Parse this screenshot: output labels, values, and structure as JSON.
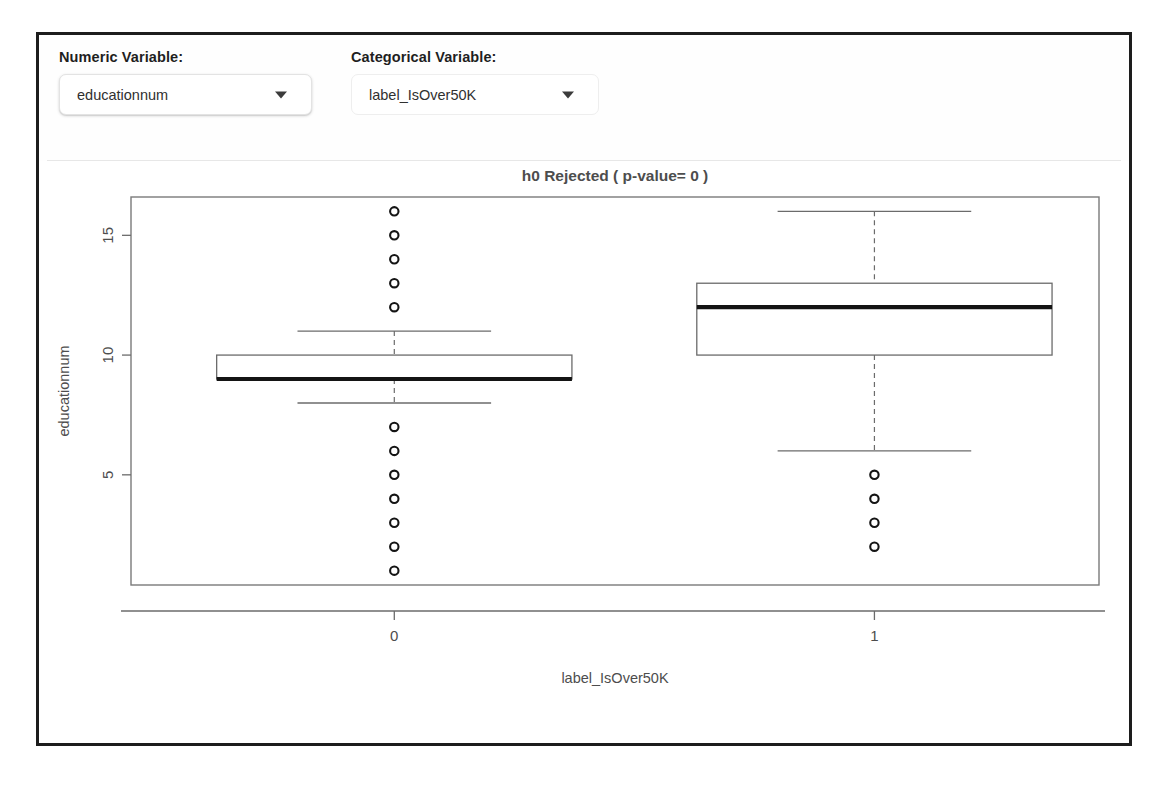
{
  "controls": {
    "numeric": {
      "label": "Numeric Variable:",
      "value": "educationnum",
      "caret_icon": "chevron-down-icon"
    },
    "categorical": {
      "label": "Categorical Variable:",
      "value": "label_IsOver50K",
      "caret_icon": "chevron-down-icon"
    }
  },
  "chart_data": {
    "type": "boxplot",
    "title": "h0 Rejected ( p-value= 0 )",
    "xlabel": "label_IsOver50K",
    "ylabel": "educationnum",
    "categories": [
      "0",
      "1"
    ],
    "yticks": [
      5,
      10,
      15
    ],
    "ylim": [
      0.4,
      16.6
    ],
    "grid": false,
    "legend": "none",
    "series": [
      {
        "name": "0",
        "min_whisker": 8,
        "q1": 9,
        "median": 9,
        "q3": 10,
        "max_whisker": 11,
        "outliers": [
          16,
          15,
          14,
          13,
          12,
          7,
          6,
          5,
          4,
          3,
          2,
          1
        ]
      },
      {
        "name": "1",
        "min_whisker": 6,
        "q1": 10,
        "median": 12,
        "q3": 13,
        "max_whisker": 16,
        "outliers": [
          5,
          4,
          3,
          2
        ]
      }
    ],
    "colors": {
      "box_stroke": "#6b6b6b",
      "median_stroke": "#141414",
      "whisker_stroke": "#6b6b6b",
      "outlier_stroke": "#141414",
      "panel_border": "#7a7a7a",
      "axis": "#6b6b6b",
      "text": "#4d4d4d"
    }
  }
}
